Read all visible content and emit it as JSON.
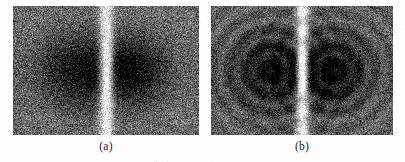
{
  "figure": {
    "background_color": "#fefefe",
    "width": 405,
    "height": 162,
    "panels": [
      {
        "id": "a",
        "label": "(a)",
        "x": 13,
        "y": 6,
        "width": 186,
        "height": 129,
        "rings": false
      },
      {
        "id": "b",
        "label": "(b)",
        "x": 211,
        "y": 6,
        "width": 182,
        "height": 129,
        "rings": true
      }
    ]
  },
  "chart_data": {
    "type": "heatmap",
    "title": "",
    "xlabel": "",
    "ylabel": "",
    "colormap": "grayscale",
    "value_range": [
      0,
      255
    ],
    "panels": [
      {
        "id": "a",
        "label": "(a)",
        "grid": [
          186,
          129
        ],
        "noise_sigma": 30,
        "background_level": 118,
        "ridge": {
          "x_fraction": 0.5,
          "width_px": 9,
          "peak_level": 252
        },
        "lobes": [
          {
            "cx_fraction": 0.35,
            "cy_fraction": 0.5,
            "rx_px": 46,
            "ry_px": 40,
            "min_level": 18
          },
          {
            "cx_fraction": 0.65,
            "cy_fraction": 0.5,
            "rx_px": 40,
            "ry_px": 36,
            "min_level": 16
          }
        ],
        "fringe_rings": {
          "enabled": false,
          "period_px": 0,
          "amplitude": 0
        }
      },
      {
        "id": "b",
        "label": "(b)",
        "grid": [
          182,
          129
        ],
        "noise_sigma": 28,
        "background_level": 112,
        "ridge": {
          "x_fraction": 0.5,
          "width_px": 8,
          "peak_level": 250
        },
        "lobes": [
          {
            "cx_fraction": 0.33,
            "cy_fraction": 0.5,
            "rx_px": 48,
            "ry_px": 44,
            "min_level": 16
          },
          {
            "cx_fraction": 0.67,
            "cy_fraction": 0.5,
            "rx_px": 44,
            "ry_px": 42,
            "min_level": 14
          }
        ],
        "fringe_rings": {
          "enabled": true,
          "period_px": 17,
          "amplitude": 26
        }
      }
    ]
  }
}
